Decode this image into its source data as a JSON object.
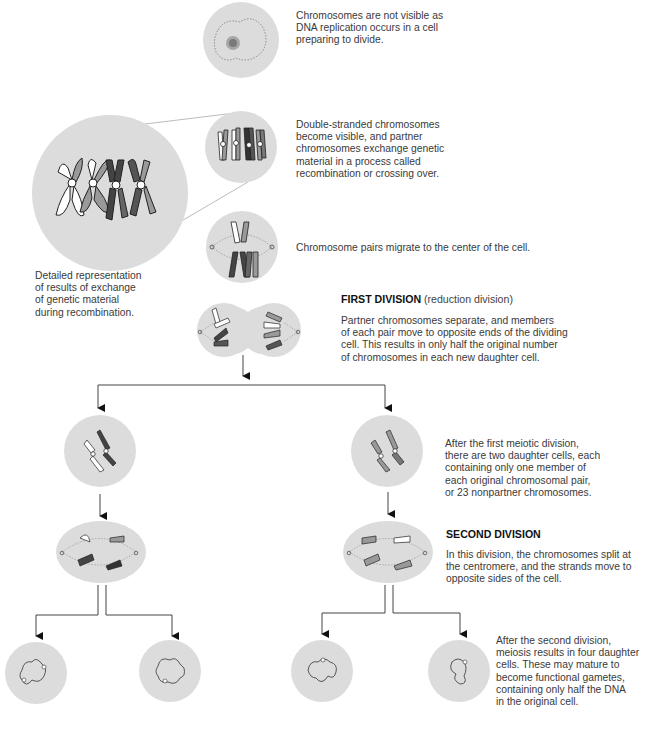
{
  "diagram": {
    "title": "Meiosis",
    "colors": {
      "cell_fill": "#dcdcdc",
      "line": "#444444",
      "spindle": "#8a8a8a",
      "chromosome_dark": "#3e3e3e",
      "chromosome_mid": "#8a8a8a",
      "chromosome_light": "#ffffff",
      "text": "#3a3a3a"
    },
    "stages": [
      {
        "id": "interphase",
        "caption": "Chromosomes are not visible as\nDNA replication occurs in a cell\npreparing to divide."
      },
      {
        "id": "prophase-recombination",
        "caption": "Double-stranded chromosomes\nbecome visible, and partner\nchromosomes exchange genetic\nmaterial in a process called\nrecombination or crossing over."
      },
      {
        "id": "detail-callout",
        "caption": "Detailed representation\nof results of exchange\nof genetic material\nduring recombination."
      },
      {
        "id": "metaphase-1",
        "caption": "Chromosome pairs migrate to the center of the cell."
      },
      {
        "id": "first-division",
        "heading": "FIRST DIVISION",
        "heading_note": "(reduction division)",
        "caption": "Partner chromosomes separate, and members\nof each pair move to opposite ends of the dividing\ncell. This results in only half the original number\nof chromosomes in each new daughter cell."
      },
      {
        "id": "daughter-cells",
        "caption": "After the first meiotic division,\nthere are two daughter cells, each\ncontaining only one member of\neach original chromosomal pair,\nor 23 nonpartner chromosomes."
      },
      {
        "id": "second-division",
        "heading": "SECOND DIVISION",
        "caption": "In this division, the chromosomes split at\nthe centromere, and the strands move to\nopposite sides of the cell."
      },
      {
        "id": "gametes",
        "caption": "After the second division,\nmeiosis results in four daughter\ncells. These may mature to\nbecome functional gametes,\ncontaining only half the DNA\nin the original cell."
      }
    ]
  }
}
